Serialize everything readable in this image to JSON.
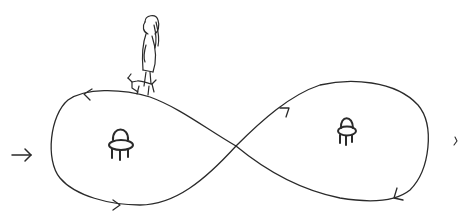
{
  "drawing": {
    "description": "Hand-drawn figure-eight path with two chairs, a girl walking a dog on top of the left loop, and an entry arrow on the left",
    "stroke_color": "#2a2a2a",
    "background_color": "#ffffff",
    "elements": {
      "path": {
        "shape": "figure-eight",
        "direction_arrows": 4
      },
      "left_chair": {
        "label": "chair"
      },
      "right_chair": {
        "label": "chair"
      },
      "figure": {
        "label": "girl walking dog"
      },
      "entry_arrow": {
        "label": "→"
      }
    }
  }
}
